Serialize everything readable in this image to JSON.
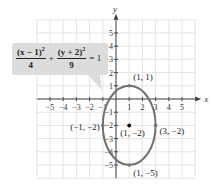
{
  "chart_data": {
    "type": "scatter",
    "title": "",
    "xlabel": "x",
    "ylabel": "y",
    "xlim": [
      -6,
      6
    ],
    "ylim": [
      -6,
      6
    ],
    "grid": true,
    "x_ticks": [
      -5,
      -4,
      -3,
      -2,
      -1,
      1,
      2,
      3,
      4,
      5
    ],
    "y_ticks": [
      5,
      4,
      3,
      2,
      1,
      -1,
      -2,
      -3,
      -4,
      -5
    ],
    "equation": {
      "num1": "(x − 1)",
      "den1": "4",
      "op": "+",
      "num2": "(y + 2)",
      "den2": "9",
      "rhs": "= 1",
      "exp": "2"
    },
    "ellipse": {
      "center": [
        1,
        -2
      ],
      "a": 2,
      "b": 3,
      "color": "#707070"
    },
    "points": [
      {
        "x": 1,
        "y": 1,
        "label": "(1, 1)"
      },
      {
        "x": 1,
        "y": -2,
        "label": "(1, −2)",
        "center": true
      },
      {
        "x": -1,
        "y": -2,
        "label": "(−1, −2)"
      },
      {
        "x": 3,
        "y": -2,
        "label": "(3, −2)"
      },
      {
        "x": 1,
        "y": -5,
        "label": "(1, −5)"
      }
    ]
  }
}
